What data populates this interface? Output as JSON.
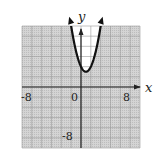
{
  "chart_data": {
    "type": "line",
    "title": "",
    "xlabel": "x",
    "ylabel": "y",
    "xlim": [
      -12,
      12
    ],
    "ylim": [
      -12,
      12
    ],
    "grid": true,
    "grid_step": 2,
    "tick_labels": {
      "x": [
        {
          "value": -8,
          "label": "-8"
        },
        {
          "value": 0,
          "label": "0"
        },
        {
          "value": 8,
          "label": "8"
        }
      ],
      "y": [
        {
          "value": -8,
          "label": "-8"
        }
      ]
    },
    "series": [
      {
        "name": "parabola",
        "equation": "y = (x - 1)^2 + 3",
        "x": [
          -2,
          -1,
          0,
          1,
          2,
          3,
          4
        ],
        "y": [
          12,
          7,
          4,
          3,
          4,
          7,
          12
        ],
        "arrows_at_ends": true
      }
    ]
  },
  "labels": {
    "x_axis": "x",
    "y_axis": "y",
    "x_neg": "-8",
    "origin": "0",
    "x_pos": "8",
    "y_neg": "-8"
  }
}
